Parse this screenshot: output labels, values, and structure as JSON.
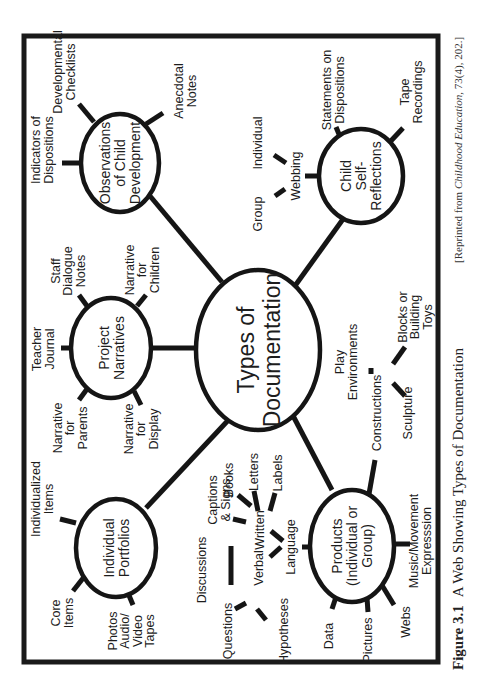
{
  "figure": {
    "number": "Figure 3.1",
    "caption": "A Web Showing Types of Documentation",
    "source_prefix": "[Reprinted from ",
    "source_journal": "Childhood Education,",
    "source_suffix": " 73(4), 202.]",
    "orientation": "rotated 90° counter-clockwise"
  },
  "center": {
    "label_lines": [
      "Types of",
      "Documentation"
    ]
  },
  "nodes": [
    {
      "id": "observations",
      "label_lines": [
        "Observations",
        "of Child",
        "Development"
      ],
      "leaves": [
        {
          "lines": [
            "Indicators of",
            "Dispositions"
          ]
        },
        {
          "lines": [
            "Developmental",
            "Checklists"
          ]
        },
        {
          "lines": [
            "Anecdotal",
            "Notes"
          ]
        }
      ]
    },
    {
      "id": "self-reflections",
      "label_lines": [
        "Child",
        "Self-",
        "Reflections"
      ],
      "leaves": [
        {
          "lines": [
            "Webbing"
          ],
          "children": [
            {
              "lines": [
                "Group"
              ]
            },
            {
              "lines": [
                "Individual"
              ]
            }
          ]
        },
        {
          "lines": [
            "Statements on",
            "Dispositions"
          ]
        },
        {
          "lines": [
            "Tape",
            "Recordings"
          ]
        }
      ]
    },
    {
      "id": "project-narratives",
      "label_lines": [
        "Project",
        "Narratives"
      ],
      "leaves": [
        {
          "lines": [
            "Teacher",
            "Journal"
          ]
        },
        {
          "lines": [
            "Staff",
            "Dialogue",
            "Notes"
          ]
        },
        {
          "lines": [
            "Narrative",
            "for",
            "Children"
          ]
        },
        {
          "lines": [
            "Narrative",
            "for",
            "Parents"
          ]
        },
        {
          "lines": [
            "Narrative",
            "for",
            "Display"
          ]
        }
      ]
    },
    {
      "id": "portfolios",
      "label_lines": [
        "Individual",
        "Portfolios"
      ],
      "leaves": [
        {
          "lines": [
            "Individualized",
            "Items"
          ]
        },
        {
          "lines": [
            "Core",
            "Items"
          ]
        },
        {
          "lines": [
            "Photos",
            "Audio/",
            "Video",
            "Tapes"
          ]
        }
      ]
    },
    {
      "id": "products",
      "label_lines": [
        "Products",
        "(Individual or",
        "Group)"
      ],
      "leaves": [
        {
          "lines": [
            "Language"
          ],
          "children": [
            {
              "lines": [
                "Verbal"
              ],
              "children": [
                {
                  "lines": [
                    "Discussions"
                  ]
                },
                {
                  "lines": [
                    "Questions"
                  ]
                },
                {
                  "lines": [
                    "Hypotheses"
                  ]
                }
              ]
            },
            {
              "lines": [
                "Written"
              ],
              "children": [
                {
                  "lines": [
                    "Captions",
                    "& Signs"
                  ]
                },
                {
                  "lines": [
                    "Books"
                  ]
                },
                {
                  "lines": [
                    "Letters"
                  ]
                },
                {
                  "lines": [
                    "Labels"
                  ]
                }
              ]
            }
          ]
        },
        {
          "lines": [
            "Data"
          ]
        },
        {
          "lines": [
            "Pictures"
          ]
        },
        {
          "lines": [
            "Webs"
          ]
        },
        {
          "lines": [
            "Music/Movement",
            "Expresssion"
          ]
        },
        {
          "lines": [
            "Constructions"
          ],
          "children": [
            {
              "lines": [
                "Play",
                "Environments"
              ]
            },
            {
              "lines": [
                "Blocks or",
                "Building",
                "Toys"
              ]
            },
            {
              "lines": [
                "Sculpture"
              ]
            }
          ]
        }
      ]
    }
  ],
  "colors": {
    "ink": "#151515",
    "paper": "#ffffff"
  }
}
